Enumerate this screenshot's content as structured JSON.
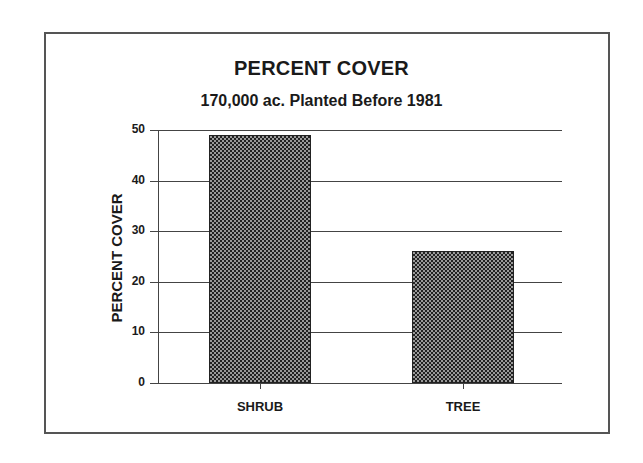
{
  "chart_data": {
    "type": "bar",
    "title": "PERCENT COVER",
    "subtitle": "170,000 ac. Planted Before 1981",
    "xlabel": "",
    "ylabel": "PERCENT COVER",
    "categories": [
      "SHRUB",
      "TREE"
    ],
    "values": [
      49,
      26
    ],
    "ylim": [
      0,
      50
    ],
    "yticks": [
      0,
      10,
      20,
      30,
      40,
      50
    ],
    "grid": true,
    "legend": null,
    "bar_fill": "checkered dark gray"
  }
}
